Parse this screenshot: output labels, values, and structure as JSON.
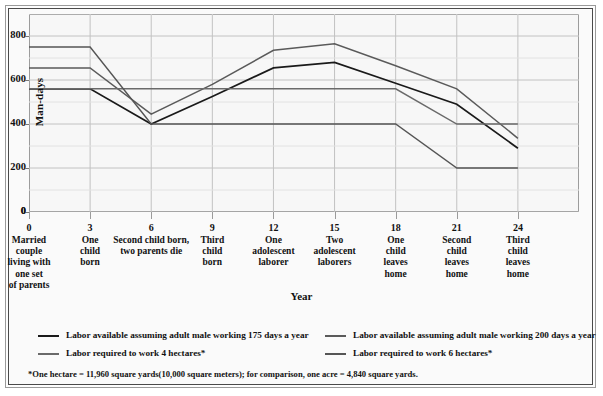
{
  "chart_data": {
    "type": "line",
    "title": "",
    "xlabel": "Year",
    "ylabel": "Man-days",
    "ylim": [
      0,
      900
    ],
    "yticks": [
      0,
      200,
      400,
      600,
      800
    ],
    "xlim": [
      0,
      27
    ],
    "x": [
      0,
      3,
      6,
      9,
      12,
      15,
      18,
      21,
      24
    ],
    "xticks": [
      0,
      3,
      6,
      9,
      12,
      15,
      18,
      21,
      24
    ],
    "grid": true,
    "legend_position": "below-plot",
    "xtick_labels": [
      "Married couple living with one set of parents",
      "One child born",
      "Second child born, two parents die",
      "Third child born",
      "One adolescent laborer",
      "Two adolescent laborers",
      "One child leaves home",
      "Second child leaves home",
      "Third child leaves home"
    ],
    "xtick_label_lines": [
      [
        "Married",
        "couple",
        "living with",
        "one set",
        "of parents"
      ],
      [
        "One",
        "child",
        "born"
      ],
      [
        "Second child born,",
        "two parents die"
      ],
      [
        "Third",
        "child",
        "born"
      ],
      [
        "One",
        "adolescent",
        "laborer"
      ],
      [
        "Two",
        "adolescent",
        "laborers"
      ],
      [
        "One",
        "child",
        "leaves",
        "home"
      ],
      [
        "Second",
        "child",
        "leaves",
        "home"
      ],
      [
        "Third",
        "child",
        "leaves",
        "home"
      ]
    ],
    "series": [
      {
        "name": "Labor available assuming adult male working 175 days a year",
        "short": "available-175",
        "color": "#1a1a1a",
        "width": 1.7,
        "values": [
          560,
          560,
          400,
          525,
          655,
          680,
          585,
          490,
          290
        ]
      },
      {
        "name": "Labor available assuming adult male working 200 days a year",
        "short": "available-200",
        "color": "#5a5a5a",
        "width": 1.5,
        "values": [
          655,
          655,
          445,
          580,
          735,
          765,
          665,
          560,
          335
        ]
      },
      {
        "name": "Labor required to work 4 hectares*",
        "short": "required-4ha",
        "color": "#6a6a6a",
        "width": 1.4,
        "values": [
          560,
          560,
          560,
          560,
          560,
          560,
          560,
          400,
          400
        ]
      },
      {
        "name": "Labor required to work 6 hectares*",
        "short": "required-6ha",
        "color": "#555555",
        "width": 1.4,
        "values": [
          750,
          750,
          400,
          400,
          400,
          400,
          400,
          200,
          200
        ]
      }
    ]
  },
  "axis": {
    "ylabel": "Man-days",
    "xlabel": "Year",
    "ytick_labels": [
      "0",
      "200",
      "400",
      "600",
      "800"
    ]
  },
  "legend": [
    {
      "label": "Labor available assuming adult male working 175 days a year",
      "color": "#1a1a1a",
      "name": "legend-available-175"
    },
    {
      "label": "Labor available assuming adult male working 200 days a year",
      "color": "#5a5a5a",
      "name": "legend-available-200"
    },
    {
      "label": "Labor required to work 4 hectares*",
      "color": "#6a6a6a",
      "name": "legend-required-4ha"
    },
    {
      "label": "Labor required to work 6 hectares*",
      "color": "#555555",
      "name": "legend-required-6ha"
    }
  ],
  "footnote": "*One hectare = 11,960 square yards(10,000 square meters); for comparison, one acre = 4,840 square yards."
}
